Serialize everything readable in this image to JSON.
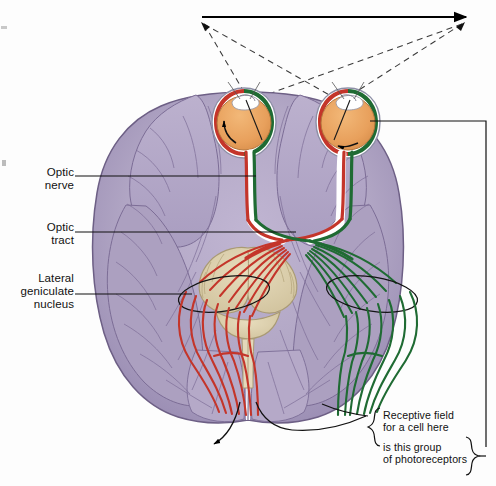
{
  "figure": {
    "type": "anatomical-diagram"
  },
  "labels": {
    "optic_nerve": "Optic\nnerve",
    "optic_tract": "Optic\ntract",
    "lateral_geniculate_nucleus": "Lateral\ngeniculate\nnucleus",
    "receptive_field": "Receptive field\nfor a cell here",
    "photoreceptors": "is this group\nof photoreceptors"
  },
  "colors": {
    "left_hemifield_pathway": "#c4352a",
    "right_hemifield_pathway": "#1f6b33",
    "brain_cortex": "#b3a8c6",
    "brain_cortex_dark": "#9a8db2",
    "brain_outline": "#6d5f85",
    "sulci": "#7c6d96",
    "eye_globe": "#eaa35e",
    "eye_sclera": "#ffffff",
    "brainstem": "#ddd0ad",
    "brainstem_outline": "#a99a74",
    "leader_line": "#111111",
    "stimulus_arrow": "#000000",
    "sight_line": "#333333"
  },
  "structures": {
    "stimulus_arrow": "horizontal solid arrow pointing right, above the eyes",
    "sight_lines": "dashed lines crossing in an X from each eye to the ends of the stimulus arrow",
    "left_eye": "left eyeball with lens, red nasal retina and green temporal retina",
    "right_eye": "right eyeball with lens, red nasal retina and green temporal retina",
    "optic_chiasm": "crossing point of red and green fibers below the eyes",
    "lgn_left": "black ellipse outline in the left hemisphere",
    "lgn_right": "black ellipse outline in the right hemisphere",
    "optic_radiations": "fanned red and green fiber bundles sweeping to the occipital lobes",
    "cerebellum_brainstem": "tan midbrain, pons and cerebellum at the center",
    "occipital_pointer": "black curved leader lines from the occipital cortex to the receptive-field note",
    "retina_connector": "long line from the right eye retina around the right side down to the photoreceptor brace"
  },
  "braces": {
    "receptive_field_brace": "{",
    "photoreceptor_brace": "}"
  }
}
